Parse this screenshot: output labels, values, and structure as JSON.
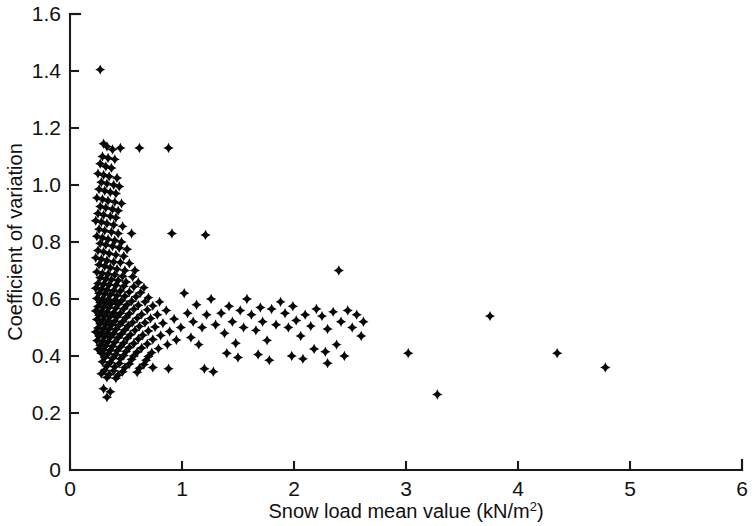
{
  "chart": {
    "type": "scatter",
    "title": "",
    "xlabel_text": "Snow load mean value (kN/m",
    "xlabel_sup": "2",
    "xlabel_tail": ")",
    "xlabel_full": "Snow load mean value (kN/m2)",
    "ylabel": "Coefficient of variation",
    "marker_color": "#080808",
    "axis_color": "#1a1a1a",
    "background": "#ffffff"
  },
  "chart_data": {
    "type": "scatter",
    "title": "",
    "xlabel": "Snow load mean value (kN/m^2)",
    "ylabel": "Coefficient of variation",
    "xlim": [
      0,
      6
    ],
    "ylim": [
      0,
      1.6
    ],
    "xticks": [
      0,
      1,
      2,
      3,
      4,
      5,
      6
    ],
    "xtick_labels": [
      "0",
      "1",
      "2",
      "3",
      "4",
      "5",
      "6"
    ],
    "yticks": [
      0,
      0.2,
      0.4,
      0.6,
      0.8,
      1.0,
      1.2,
      1.4,
      1.6
    ],
    "ytick_labels": [
      "0",
      "0.2",
      "0.4",
      "0.6",
      "0.8",
      "1.0",
      "1.2",
      "1.4",
      "1.6"
    ],
    "grid": false,
    "legend": null,
    "marker": "diamond-filled",
    "n_points": 330,
    "series": [
      {
        "name": "Snow load stations",
        "points": [
          [
            0.27,
            1.405
          ],
          [
            0.3,
            1.145
          ],
          [
            0.33,
            1.135
          ],
          [
            0.38,
            1.125
          ],
          [
            0.45,
            1.13
          ],
          [
            0.62,
            1.13
          ],
          [
            0.88,
            1.13
          ],
          [
            0.29,
            1.1
          ],
          [
            0.34,
            1.095
          ],
          [
            0.4,
            1.09
          ],
          [
            0.27,
            1.075
          ],
          [
            0.32,
            1.065
          ],
          [
            0.37,
            1.06
          ],
          [
            0.25,
            1.04
          ],
          [
            0.3,
            1.035
          ],
          [
            0.35,
            1.03
          ],
          [
            0.42,
            1.025
          ],
          [
            0.28,
            1.01
          ],
          [
            0.33,
            1.005
          ],
          [
            0.39,
            1.0
          ],
          [
            0.44,
            0.995
          ],
          [
            0.26,
            0.985
          ],
          [
            0.31,
            0.98
          ],
          [
            0.36,
            0.975
          ],
          [
            0.41,
            0.97
          ],
          [
            0.24,
            0.955
          ],
          [
            0.29,
            0.95
          ],
          [
            0.34,
            0.945
          ],
          [
            0.4,
            0.94
          ],
          [
            0.46,
            0.935
          ],
          [
            0.27,
            0.925
          ],
          [
            0.32,
            0.92
          ],
          [
            0.38,
            0.915
          ],
          [
            0.43,
            0.91
          ],
          [
            0.25,
            0.9
          ],
          [
            0.3,
            0.895
          ],
          [
            0.36,
            0.89
          ],
          [
            0.41,
            0.885
          ],
          [
            0.23,
            0.875
          ],
          [
            0.28,
            0.87
          ],
          [
            0.33,
            0.865
          ],
          [
            0.39,
            0.86
          ],
          [
            0.47,
            0.855
          ],
          [
            0.26,
            0.845
          ],
          [
            0.31,
            0.84
          ],
          [
            0.37,
            0.835
          ],
          [
            0.43,
            0.83
          ],
          [
            0.55,
            0.83
          ],
          [
            0.91,
            0.83
          ],
          [
            1.21,
            0.825
          ],
          [
            0.24,
            0.82
          ],
          [
            0.29,
            0.815
          ],
          [
            0.34,
            0.81
          ],
          [
            0.4,
            0.805
          ],
          [
            0.46,
            0.8
          ],
          [
            0.27,
            0.795
          ],
          [
            0.32,
            0.79
          ],
          [
            0.38,
            0.785
          ],
          [
            0.44,
            0.78
          ],
          [
            0.51,
            0.775
          ],
          [
            0.25,
            0.77
          ],
          [
            0.3,
            0.765
          ],
          [
            0.35,
            0.76
          ],
          [
            0.41,
            0.755
          ],
          [
            0.48,
            0.75
          ],
          [
            0.23,
            0.745
          ],
          [
            0.28,
            0.74
          ],
          [
            0.33,
            0.735
          ],
          [
            0.39,
            0.73
          ],
          [
            0.45,
            0.728
          ],
          [
            0.53,
            0.725
          ],
          [
            0.26,
            0.72
          ],
          [
            0.31,
            0.715
          ],
          [
            0.36,
            0.71
          ],
          [
            0.42,
            0.705
          ],
          [
            0.49,
            0.7
          ],
          [
            0.58,
            0.7
          ],
          [
            2.4,
            0.7
          ],
          [
            0.24,
            0.695
          ],
          [
            0.29,
            0.69
          ],
          [
            0.34,
            0.688
          ],
          [
            0.4,
            0.685
          ],
          [
            0.47,
            0.68
          ],
          [
            0.56,
            0.678
          ],
          [
            0.27,
            0.675
          ],
          [
            0.32,
            0.67
          ],
          [
            0.37,
            0.668
          ],
          [
            0.43,
            0.665
          ],
          [
            0.5,
            0.66
          ],
          [
            0.61,
            0.658
          ],
          [
            0.25,
            0.655
          ],
          [
            0.3,
            0.652
          ],
          [
            0.35,
            0.65
          ],
          [
            0.41,
            0.648
          ],
          [
            0.48,
            0.645
          ],
          [
            0.57,
            0.643
          ],
          [
            0.66,
            0.64
          ],
          [
            0.23,
            0.638
          ],
          [
            0.28,
            0.635
          ],
          [
            0.33,
            0.632
          ],
          [
            0.39,
            0.63
          ],
          [
            0.45,
            0.628
          ],
          [
            0.53,
            0.625
          ],
          [
            0.63,
            0.622
          ],
          [
            0.26,
            0.62
          ],
          [
            0.31,
            0.618
          ],
          [
            0.36,
            0.615
          ],
          [
            0.42,
            0.612
          ],
          [
            0.49,
            0.61
          ],
          [
            0.59,
            0.608
          ],
          [
            0.7,
            0.605
          ],
          [
            0.24,
            0.602
          ],
          [
            0.29,
            0.6
          ],
          [
            0.34,
            0.598
          ],
          [
            0.4,
            0.596
          ],
          [
            0.46,
            0.594
          ],
          [
            0.55,
            0.592
          ],
          [
            0.67,
            0.59
          ],
          [
            0.8,
            0.59
          ],
          [
            0.27,
            0.588
          ],
          [
            0.32,
            0.586
          ],
          [
            0.37,
            0.584
          ],
          [
            0.43,
            0.582
          ],
          [
            0.51,
            0.58
          ],
          [
            0.61,
            0.578
          ],
          [
            0.74,
            0.576
          ],
          [
            0.25,
            0.574
          ],
          [
            0.3,
            0.572
          ],
          [
            0.35,
            0.57
          ],
          [
            0.41,
            0.568
          ],
          [
            0.48,
            0.566
          ],
          [
            0.57,
            0.564
          ],
          [
            0.69,
            0.562
          ],
          [
            0.86,
            0.56
          ],
          [
            0.23,
            0.558
          ],
          [
            0.28,
            0.556
          ],
          [
            0.33,
            0.554
          ],
          [
            0.39,
            0.552
          ],
          [
            0.45,
            0.55
          ],
          [
            0.53,
            0.548
          ],
          [
            0.64,
            0.546
          ],
          [
            0.78,
            0.545
          ],
          [
            0.26,
            0.543
          ],
          [
            0.31,
            0.541
          ],
          [
            0.36,
            0.539
          ],
          [
            0.42,
            0.537
          ],
          [
            0.5,
            0.535
          ],
          [
            0.6,
            0.533
          ],
          [
            0.72,
            0.532
          ],
          [
            0.93,
            0.53
          ],
          [
            0.24,
            0.528
          ],
          [
            0.29,
            0.526
          ],
          [
            0.34,
            0.524
          ],
          [
            0.4,
            0.522
          ],
          [
            0.47,
            0.52
          ],
          [
            0.56,
            0.518
          ],
          [
            0.67,
            0.517
          ],
          [
            0.83,
            0.515
          ],
          [
            0.27,
            0.513
          ],
          [
            0.32,
            0.511
          ],
          [
            0.37,
            0.509
          ],
          [
            0.44,
            0.508
          ],
          [
            0.52,
            0.506
          ],
          [
            0.62,
            0.504
          ],
          [
            0.76,
            0.502
          ],
          [
            0.99,
            0.5
          ],
          [
            0.25,
            0.498
          ],
          [
            0.3,
            0.496
          ],
          [
            0.35,
            0.495
          ],
          [
            0.41,
            0.493
          ],
          [
            0.49,
            0.491
          ],
          [
            0.58,
            0.49
          ],
          [
            0.7,
            0.488
          ],
          [
            0.89,
            0.486
          ],
          [
            0.23,
            0.484
          ],
          [
            0.28,
            0.482
          ],
          [
            0.33,
            0.48
          ],
          [
            0.39,
            0.479
          ],
          [
            0.46,
            0.477
          ],
          [
            0.54,
            0.475
          ],
          [
            0.65,
            0.473
          ],
          [
            0.81,
            0.472
          ],
          [
            0.26,
            0.47
          ],
          [
            0.31,
            0.468
          ],
          [
            0.36,
            0.466
          ],
          [
            0.43,
            0.464
          ],
          [
            0.51,
            0.462
          ],
          [
            0.61,
            0.46
          ],
          [
            0.74,
            0.458
          ],
          [
            0.95,
            0.456
          ],
          [
            0.24,
            0.454
          ],
          [
            0.29,
            0.452
          ],
          [
            0.34,
            0.45
          ],
          [
            0.4,
            0.448
          ],
          [
            0.48,
            0.446
          ],
          [
            0.57,
            0.444
          ],
          [
            0.69,
            0.442
          ],
          [
            0.87,
            0.44
          ],
          [
            0.27,
            0.438
          ],
          [
            0.32,
            0.436
          ],
          [
            0.38,
            0.434
          ],
          [
            0.45,
            0.432
          ],
          [
            0.53,
            0.43
          ],
          [
            0.64,
            0.428
          ],
          [
            0.79,
            0.426
          ],
          [
            0.25,
            0.424
          ],
          [
            0.3,
            0.422
          ],
          [
            0.36,
            0.42
          ],
          [
            0.42,
            0.418
          ],
          [
            0.5,
            0.416
          ],
          [
            0.6,
            0.414
          ],
          [
            0.73,
            0.412
          ],
          [
            0.28,
            0.41
          ],
          [
            0.34,
            0.408
          ],
          [
            0.41,
            0.405
          ],
          [
            0.48,
            0.402
          ],
          [
            0.57,
            0.4
          ],
          [
            0.7,
            0.398
          ],
          [
            0.31,
            0.395
          ],
          [
            0.38,
            0.392
          ],
          [
            0.45,
            0.39
          ],
          [
            0.55,
            0.388
          ],
          [
            0.68,
            0.385
          ],
          [
            0.29,
            0.38
          ],
          [
            0.36,
            0.377
          ],
          [
            0.44,
            0.374
          ],
          [
            0.53,
            0.372
          ],
          [
            0.66,
            0.37
          ],
          [
            0.33,
            0.365
          ],
          [
            0.4,
            0.362
          ],
          [
            0.49,
            0.36
          ],
          [
            0.62,
            0.357
          ],
          [
            0.31,
            0.35
          ],
          [
            0.39,
            0.348
          ],
          [
            0.47,
            0.345
          ],
          [
            0.6,
            0.343
          ],
          [
            0.74,
            0.36
          ],
          [
            0.88,
            0.355
          ],
          [
            0.28,
            0.338
          ],
          [
            0.35,
            0.335
          ],
          [
            0.43,
            0.333
          ],
          [
            0.33,
            0.325
          ],
          [
            0.41,
            0.322
          ],
          [
            0.3,
            0.285
          ],
          [
            0.36,
            0.275
          ],
          [
            0.33,
            0.255
          ],
          [
            1.02,
            0.62
          ],
          [
            1.05,
            0.55
          ],
          [
            1.1,
            0.52
          ],
          [
            1.13,
            0.58
          ],
          [
            1.18,
            0.5
          ],
          [
            1.08,
            0.465
          ],
          [
            1.15,
            0.44
          ],
          [
            1.22,
            0.545
          ],
          [
            1.26,
            0.6
          ],
          [
            1.3,
            0.51
          ],
          [
            1.2,
            0.355
          ],
          [
            1.28,
            0.345
          ],
          [
            1.35,
            0.55
          ],
          [
            1.38,
            0.48
          ],
          [
            1.42,
            0.575
          ],
          [
            1.45,
            0.52
          ],
          [
            1.48,
            0.445
          ],
          [
            1.52,
            0.56
          ],
          [
            1.55,
            0.5
          ],
          [
            1.58,
            0.6
          ],
          [
            1.4,
            0.41
          ],
          [
            1.5,
            0.395
          ],
          [
            1.62,
            0.545
          ],
          [
            1.66,
            0.49
          ],
          [
            1.7,
            0.57
          ],
          [
            1.72,
            0.52
          ],
          [
            1.76,
            0.455
          ],
          [
            1.8,
            0.565
          ],
          [
            1.84,
            0.51
          ],
          [
            1.88,
            0.59
          ],
          [
            1.68,
            0.405
          ],
          [
            1.78,
            0.385
          ],
          [
            1.92,
            0.55
          ],
          [
            1.95,
            0.5
          ],
          [
            1.99,
            0.575
          ],
          [
            2.02,
            0.525
          ],
          [
            2.06,
            0.47
          ],
          [
            2.1,
            0.545
          ],
          [
            2.15,
            0.505
          ],
          [
            2.2,
            0.565
          ],
          [
            1.98,
            0.4
          ],
          [
            2.08,
            0.39
          ],
          [
            2.25,
            0.54
          ],
          [
            2.3,
            0.495
          ],
          [
            2.35,
            0.555
          ],
          [
            2.18,
            0.425
          ],
          [
            2.28,
            0.415
          ],
          [
            2.42,
            0.52
          ],
          [
            2.48,
            0.56
          ],
          [
            2.52,
            0.5
          ],
          [
            2.38,
            0.44
          ],
          [
            2.56,
            0.545
          ],
          [
            2.62,
            0.52
          ],
          [
            2.6,
            0.47
          ],
          [
            2.3,
            0.375
          ],
          [
            2.45,
            0.4
          ],
          [
            3.02,
            0.41
          ],
          [
            3.28,
            0.265
          ],
          [
            3.75,
            0.54
          ],
          [
            4.35,
            0.41
          ],
          [
            4.78,
            0.36
          ]
        ]
      }
    ]
  }
}
